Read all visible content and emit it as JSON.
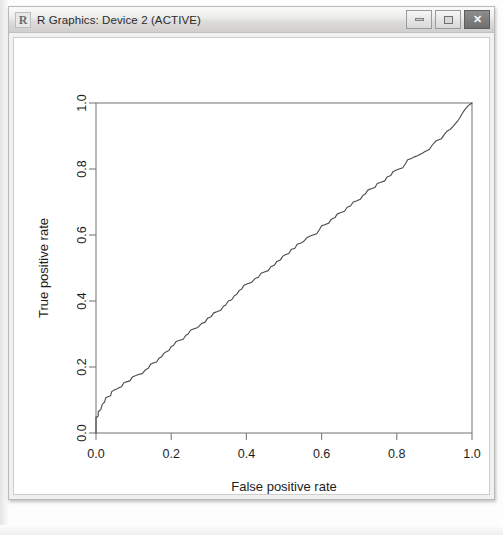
{
  "window": {
    "title": "R Graphics: Device 2 (ACTIVE)",
    "icon": "r-logo-icon",
    "buttons": {
      "minimize": "minimize-icon",
      "maximize": "maximize-icon",
      "close": "✕"
    }
  },
  "colors": {
    "titlebar_top": "#fbfbfb",
    "titlebar_bottom": "#cfcecd",
    "window_border": "#b9b9b9",
    "canvas_background": "#ffffff",
    "curve_stroke": "#4a4a4a",
    "axis_stroke": "#7d7d7d",
    "text": "#1d1d1d"
  },
  "chart_data": {
    "type": "line",
    "title": "",
    "subtitle": "",
    "xlabel": "False positive rate",
    "ylabel": "True positive rate",
    "xlim": [
      0.0,
      1.0
    ],
    "ylim": [
      0.0,
      1.0
    ],
    "grid": false,
    "legend": null,
    "legend_position": "none",
    "xticks": [
      "0.0",
      "0.2",
      "0.4",
      "0.6",
      "0.8",
      "1.0"
    ],
    "xtick_values": [
      0.0,
      0.2,
      0.4,
      0.6,
      0.8,
      1.0
    ],
    "yticks": [
      "0.0",
      "0.2",
      "0.4",
      "0.6",
      "0.8",
      "1.0"
    ],
    "ytick_values": [
      0.0,
      0.2,
      0.4,
      0.6,
      0.8,
      1.0
    ],
    "series": [
      {
        "name": "ROC curve",
        "x": [
          0.0,
          0.0,
          0.0,
          0.0,
          0.003,
          0.006,
          0.006,
          0.01,
          0.013,
          0.016,
          0.019,
          0.023,
          0.026,
          0.032,
          0.039,
          0.042,
          0.048,
          0.055,
          0.061,
          0.068,
          0.074,
          0.081,
          0.09,
          0.097,
          0.106,
          0.113,
          0.123,
          0.132,
          0.139,
          0.145,
          0.152,
          0.161,
          0.168,
          0.174,
          0.181,
          0.187,
          0.194,
          0.2,
          0.206,
          0.213,
          0.223,
          0.232,
          0.239,
          0.245,
          0.252,
          0.261,
          0.271,
          0.281,
          0.29,
          0.297,
          0.306,
          0.313,
          0.323,
          0.332,
          0.339,
          0.345,
          0.352,
          0.361,
          0.368,
          0.374,
          0.381,
          0.387,
          0.394,
          0.403,
          0.413,
          0.423,
          0.432,
          0.439,
          0.448,
          0.458,
          0.465,
          0.474,
          0.481,
          0.49,
          0.497,
          0.503,
          0.513,
          0.519,
          0.529,
          0.535,
          0.545,
          0.552,
          0.561,
          0.568,
          0.577,
          0.587,
          0.594,
          0.6,
          0.61,
          0.619,
          0.626,
          0.635,
          0.642,
          0.652,
          0.661,
          0.668,
          0.677,
          0.684,
          0.694,
          0.703,
          0.71,
          0.716,
          0.723,
          0.732,
          0.742,
          0.748,
          0.758,
          0.768,
          0.774,
          0.784,
          0.79,
          0.797,
          0.806,
          0.816,
          0.823,
          0.829,
          0.839,
          0.845,
          0.855,
          0.861,
          0.868,
          0.874,
          0.881,
          0.887,
          0.894,
          0.903,
          0.91,
          0.919,
          0.926,
          0.935,
          0.942,
          0.952,
          0.961,
          0.968,
          0.974,
          0.981,
          0.99,
          1.0
        ],
        "y": [
          0.0,
          0.015,
          0.03,
          0.048,
          0.048,
          0.052,
          0.065,
          0.068,
          0.072,
          0.085,
          0.09,
          0.094,
          0.107,
          0.11,
          0.113,
          0.126,
          0.13,
          0.133,
          0.137,
          0.14,
          0.152,
          0.155,
          0.158,
          0.17,
          0.174,
          0.177,
          0.18,
          0.192,
          0.196,
          0.208,
          0.212,
          0.215,
          0.227,
          0.23,
          0.242,
          0.246,
          0.25,
          0.262,
          0.265,
          0.277,
          0.281,
          0.284,
          0.296,
          0.3,
          0.312,
          0.316,
          0.32,
          0.332,
          0.336,
          0.348,
          0.352,
          0.364,
          0.368,
          0.372,
          0.384,
          0.388,
          0.4,
          0.404,
          0.416,
          0.42,
          0.432,
          0.436,
          0.448,
          0.452,
          0.456,
          0.468,
          0.472,
          0.484,
          0.488,
          0.492,
          0.504,
          0.508,
          0.52,
          0.524,
          0.536,
          0.54,
          0.544,
          0.556,
          0.56,
          0.572,
          0.576,
          0.58,
          0.592,
          0.596,
          0.6,
          0.604,
          0.616,
          0.628,
          0.632,
          0.636,
          0.648,
          0.652,
          0.664,
          0.668,
          0.672,
          0.684,
          0.688,
          0.7,
          0.704,
          0.708,
          0.72,
          0.724,
          0.736,
          0.74,
          0.744,
          0.756,
          0.76,
          0.764,
          0.776,
          0.78,
          0.792,
          0.796,
          0.8,
          0.804,
          0.816,
          0.828,
          0.832,
          0.836,
          0.84,
          0.844,
          0.848,
          0.852,
          0.856,
          0.86,
          0.872,
          0.884,
          0.888,
          0.892,
          0.904,
          0.916,
          0.92,
          0.932,
          0.944,
          0.956,
          0.968,
          0.98,
          0.992,
          1.0
        ]
      }
    ]
  }
}
